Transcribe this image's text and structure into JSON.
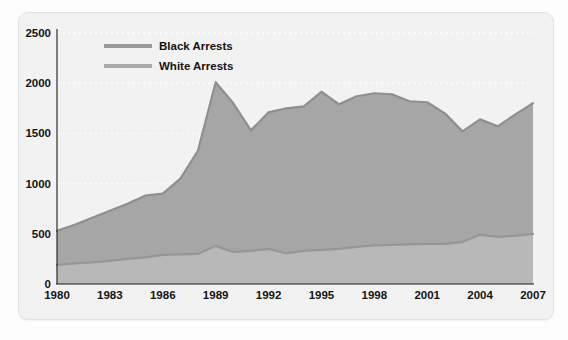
{
  "chart_data": {
    "type": "area",
    "title": "",
    "subtitle": "",
    "xlabel": "",
    "ylabel": "",
    "stacked": false,
    "grid": true,
    "legend_position": "top-left-inside",
    "xlim": [
      1980,
      2007
    ],
    "ylim": [
      0,
      2500
    ],
    "y_ticks": [
      0,
      500,
      1000,
      1500,
      2000,
      2500
    ],
    "x_ticks": [
      1980,
      1983,
      1986,
      1989,
      1992,
      1995,
      1998,
      2001,
      2004,
      2007
    ],
    "x": [
      1980,
      1981,
      1982,
      1983,
      1984,
      1985,
      1986,
      1987,
      1988,
      1989,
      1990,
      1991,
      1992,
      1993,
      1994,
      1995,
      1996,
      1997,
      1998,
      1999,
      2000,
      2001,
      2002,
      2003,
      2004,
      2005,
      2006,
      2007
    ],
    "series": [
      {
        "name": "Black Arrests",
        "color": "#a6a6a6",
        "line_color": "#8f8f8f",
        "values": [
          530,
          590,
          660,
          730,
          800,
          880,
          900,
          1050,
          1330,
          2010,
          1800,
          1530,
          1710,
          1750,
          1770,
          1915,
          1790,
          1870,
          1900,
          1890,
          1820,
          1810,
          1700,
          1520,
          1640,
          1570,
          1690,
          1800
        ]
      },
      {
        "name": "White Arrests",
        "color": "#b8b8b8",
        "line_color": "#969696",
        "values": [
          190,
          205,
          215,
          230,
          250,
          265,
          290,
          295,
          300,
          380,
          320,
          330,
          350,
          305,
          330,
          340,
          350,
          370,
          385,
          390,
          395,
          400,
          400,
          420,
          490,
          470,
          480,
          500
        ]
      }
    ],
    "legend": [
      {
        "label": "Black Arrests",
        "color": "#999999"
      },
      {
        "label": "White Arrests",
        "color": "#aaaaaa"
      }
    ]
  },
  "colors": {
    "card_background": "#f2f2f2",
    "page_background": "#fdfdfd",
    "gridline": "#ffffff",
    "axis": "#1a1a1a",
    "text": "#141414",
    "band_fill": "#a6a6a6"
  }
}
